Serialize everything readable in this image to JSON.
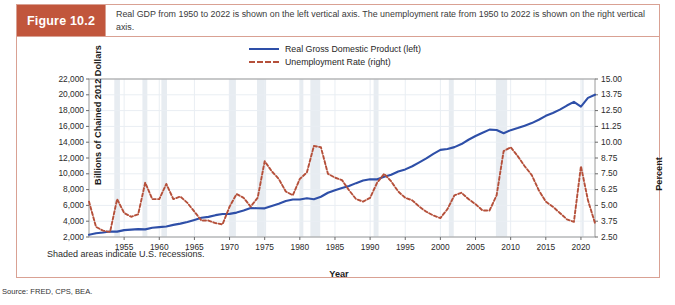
{
  "figure": {
    "number_label": "Figure 10.2",
    "caption": "Real GDP from 1950 to 2022 is shown on the left vertical axis. The unemployment rate from 1950 to 2022 is shown on the right vertical axis.",
    "note": "Shaded areas indicate U.S. recessions.",
    "source": "Source: FRED, CPS, BEA."
  },
  "colors": {
    "badge": "#c1563c",
    "border": "#d9a193",
    "gdp_line": "#2e4fa8",
    "unemployment_line": "#b5503a",
    "recession_band": "#e7ecf1",
    "gridline": "#e9eef3"
  },
  "chart_data": {
    "type": "line",
    "title": "",
    "xlabel": "Year",
    "ylabel": "Billions of Chained 2012 Dollars",
    "y2label": "Percent",
    "xlim": [
      1950,
      2022
    ],
    "ylim": [
      2000,
      22000
    ],
    "y2lim": [
      2.5,
      15.0
    ],
    "grid": true,
    "legend_position": "top-center",
    "xticks": [
      "1955",
      "1960",
      "1965",
      "1970",
      "1975",
      "1980",
      "1985",
      "1990",
      "1995",
      "2000",
      "2005",
      "2010",
      "2015",
      "2020"
    ],
    "xtick_values": [
      1955,
      1960,
      1965,
      1970,
      1975,
      1980,
      1985,
      1990,
      1995,
      2000,
      2005,
      2010,
      2015,
      2020
    ],
    "yticks": [
      "2,000",
      "4,000",
      "6,000",
      "8,000",
      "10,000",
      "12,000",
      "14,000",
      "16,000",
      "18,000",
      "20,000",
      "22,000"
    ],
    "ytick_values": [
      2000,
      4000,
      6000,
      8000,
      10000,
      12000,
      14000,
      16000,
      18000,
      20000,
      22000
    ],
    "y2ticks": [
      "2.50",
      "3.75",
      "5.00",
      "6.25",
      "7.50",
      "8.75",
      "10.00",
      "11.25",
      "12.50",
      "13.75",
      "15.00"
    ],
    "y2tick_values": [
      2.5,
      3.75,
      5.0,
      6.25,
      7.5,
      8.75,
      10.0,
      11.25,
      12.5,
      13.75,
      15.0
    ],
    "x": [
      1950,
      1951,
      1952,
      1953,
      1954,
      1955,
      1956,
      1957,
      1958,
      1959,
      1960,
      1961,
      1962,
      1963,
      1964,
      1965,
      1966,
      1967,
      1968,
      1969,
      1970,
      1971,
      1972,
      1973,
      1974,
      1975,
      1976,
      1977,
      1978,
      1979,
      1980,
      1981,
      1982,
      1983,
      1984,
      1985,
      1986,
      1987,
      1988,
      1989,
      1990,
      1991,
      1992,
      1993,
      1994,
      1995,
      1996,
      1997,
      1998,
      1999,
      2000,
      2001,
      2002,
      2003,
      2004,
      2005,
      2006,
      2007,
      2008,
      2009,
      2010,
      2011,
      2012,
      2013,
      2014,
      2015,
      2016,
      2017,
      2018,
      2019,
      2020,
      2021,
      2022
    ],
    "series": [
      {
        "name": "Real Gross Domestic Product (left)",
        "axis": "left",
        "style": "solid",
        "color": "#2e4fa8",
        "values": [
          2290,
          2474,
          2574,
          2695,
          2678,
          2871,
          2932,
          2991,
          2965,
          3171,
          3254,
          3335,
          3536,
          3692,
          3906,
          4158,
          4430,
          4545,
          4766,
          4914,
          4924,
          5088,
          5358,
          5665,
          5635,
          5626,
          5930,
          6203,
          6550,
          6756,
          6739,
          6911,
          6779,
          7091,
          7600,
          7919,
          8192,
          8465,
          8818,
          9143,
          9312,
          9297,
          9618,
          9887,
          10290,
          10556,
          10958,
          11451,
          11950,
          12515,
          13029,
          13139,
          13377,
          13762,
          14310,
          14782,
          15203,
          15595,
          15545,
          15141,
          15526,
          15783,
          16096,
          16416,
          16840,
          17337,
          17693,
          18122,
          18639,
          19098,
          18510,
          19610,
          20014
        ]
      },
      {
        "name": "Unemployment Rate (right)",
        "axis": "right",
        "style": "dashed",
        "color": "#b5503a",
        "values": [
          5.3,
          3.3,
          3.0,
          2.9,
          5.5,
          4.4,
          4.1,
          4.3,
          6.8,
          5.5,
          5.5,
          6.7,
          5.5,
          5.7,
          5.2,
          4.5,
          3.8,
          3.8,
          3.6,
          3.5,
          4.9,
          5.9,
          5.6,
          4.9,
          5.6,
          8.5,
          7.7,
          7.1,
          6.1,
          5.8,
          7.1,
          7.6,
          9.7,
          9.6,
          7.5,
          7.2,
          7.0,
          6.2,
          5.5,
          5.3,
          5.6,
          6.8,
          7.5,
          6.9,
          6.1,
          5.6,
          5.4,
          4.9,
          4.5,
          4.2,
          4.0,
          4.7,
          5.8,
          6.0,
          5.5,
          5.1,
          4.6,
          4.6,
          5.8,
          9.3,
          9.6,
          8.9,
          8.1,
          7.4,
          6.2,
          5.3,
          4.9,
          4.4,
          3.9,
          3.7,
          8.1,
          5.4,
          3.6
        ]
      }
    ],
    "recessions": [
      [
        1953.6,
        1954.4
      ],
      [
        1957.6,
        1958.3
      ],
      [
        1960.3,
        1961.1
      ],
      [
        1969.9,
        1970.9
      ],
      [
        1973.9,
        1975.2
      ],
      [
        1980.0,
        1980.5
      ],
      [
        1981.5,
        1982.9
      ],
      [
        1990.5,
        1991.2
      ],
      [
        2001.2,
        2001.9
      ],
      [
        2007.9,
        2009.5
      ],
      [
        2020.1,
        2020.4
      ]
    ]
  }
}
